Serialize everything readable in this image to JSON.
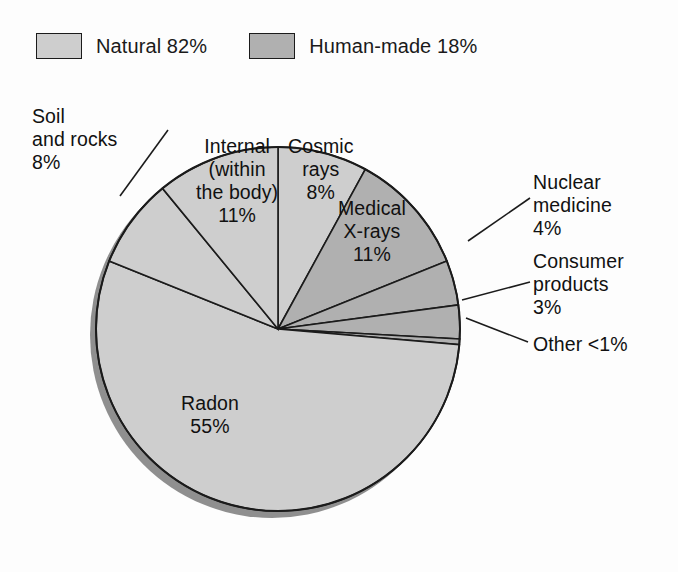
{
  "legend": {
    "items": [
      {
        "label": "Natural 82%",
        "color": "#cecece",
        "name": "natural"
      },
      {
        "label": "Human-made 18%",
        "color": "#b0b0b0",
        "name": "human-made"
      }
    ]
  },
  "labels": {
    "soil": {
      "l1": "Soil",
      "l2": "and rocks",
      "l3": "8%"
    },
    "internal": {
      "l1": "Internal",
      "l2": "(within",
      "l3": "the body)",
      "l4": "11%"
    },
    "cosmic": {
      "l1": "Cosmic",
      "l2": "rays",
      "l3": "8%"
    },
    "medical": {
      "l1": "Medical",
      "l2": "X-rays",
      "l3": "11%"
    },
    "nuclear": {
      "l1": "Nuclear",
      "l2": "medicine",
      "l3": "4%"
    },
    "consumer": {
      "l1": "Consumer",
      "l2": "products",
      "l3": "3%"
    },
    "other": {
      "l1": "Other <1%"
    },
    "radon": {
      "l1": "Radon",
      "l2": "55%"
    }
  },
  "chart_data": {
    "type": "pie",
    "title": "",
    "legend_position": "top-left",
    "categories": [
      "Cosmic rays",
      "Medical X-rays",
      "Nuclear medicine",
      "Consumer products",
      "Other",
      "Radon",
      "Soil and rocks",
      "Internal (within the body)"
    ],
    "values": [
      8,
      11,
      4,
      3,
      0.5,
      55,
      8,
      11
    ],
    "value_labels": [
      "8%",
      "11%",
      "4%",
      "3%",
      "<1%",
      "55%",
      "8%",
      "11%"
    ],
    "groups": [
      "Natural",
      "Human-made",
      "Human-made",
      "Human-made",
      "Human-made",
      "Natural",
      "Natural",
      "Natural"
    ],
    "group_totals": {
      "Natural": 82,
      "Human-made": 18
    },
    "group_labels": [
      "Natural 82%",
      "Human-made 18%"
    ],
    "colors": {
      "Natural": "#cecece",
      "Human-made": "#b0b0b0",
      "outline": "#1b1b1b",
      "shadow": "#8f8f8f"
    },
    "start_angle_deg": 0,
    "direction": "clockwise"
  }
}
